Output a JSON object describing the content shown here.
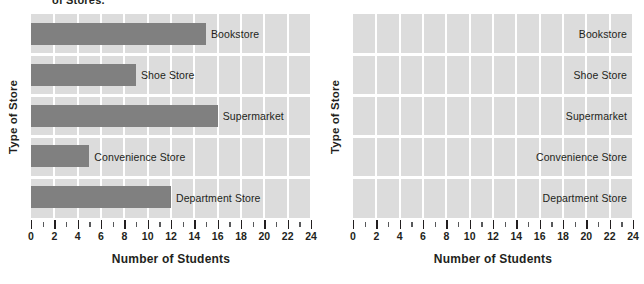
{
  "title_fragment": "of Stores.",
  "chart_data": {
    "type": "bar",
    "orientation": "horizontal",
    "title": "",
    "xlabel": "Number of Students",
    "ylabel": "Type of Store",
    "categories": [
      "Bookstore",
      "Shoe Store",
      "Supermarket",
      "Convenience Store",
      "Department Store"
    ],
    "values": [
      15,
      9,
      16,
      5,
      12
    ],
    "xlim": [
      0,
      24
    ],
    "xticks": [
      0,
      2,
      4,
      6,
      8,
      10,
      12,
      14,
      16,
      18,
      20,
      22,
      24
    ],
    "xtick_labels": [
      "0",
      "2",
      "4",
      "6",
      "8",
      "10",
      "12",
      "14",
      "16",
      "18",
      "20",
      "22",
      "24"
    ],
    "minor_xticks": [
      1,
      3,
      5,
      7,
      9,
      11,
      13,
      15,
      17,
      19,
      21,
      23
    ],
    "grid": true,
    "legend": "none",
    "bar_color": "#808080",
    "plot_background": "#dcdcdc",
    "gridline_color": "#ffffff"
  },
  "panels": [
    {
      "name": "completed-chart",
      "ylabel": "Type of Store",
      "xlabel": "Number of Students",
      "has_bars": true,
      "label_alignment": "after-bar",
      "rows": [
        {
          "label": "Bookstore",
          "value": 15
        },
        {
          "label": "Shoe Store",
          "value": 9
        },
        {
          "label": "Supermarket",
          "value": 16
        },
        {
          "label": "Convenience Store",
          "value": 5
        },
        {
          "label": "Department Store",
          "value": 12
        }
      ]
    },
    {
      "name": "blank-chart",
      "ylabel": "Type of Store",
      "xlabel": "Number of Students",
      "has_bars": false,
      "label_alignment": "right",
      "rows": [
        {
          "label": "Bookstore",
          "value": 0
        },
        {
          "label": "Shoe Store",
          "value": 0
        },
        {
          "label": "Supermarket",
          "value": 0
        },
        {
          "label": "Convenience Store",
          "value": 0
        },
        {
          "label": "Department Store",
          "value": 0
        }
      ]
    }
  ]
}
